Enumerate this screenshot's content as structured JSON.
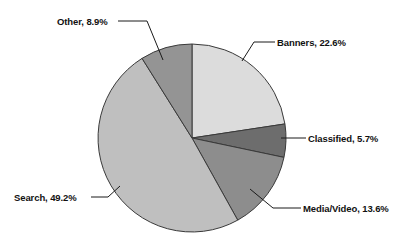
{
  "chart_data": {
    "type": "pie",
    "title": "",
    "subtitle": "",
    "xlabel": "",
    "ylabel": "",
    "legend_position": "none",
    "grid": false,
    "labels_format": "{name}, {value}%",
    "start_angle_deg": 0,
    "direction": "clockwise",
    "categories": [
      "Banners",
      "Classified",
      "Media/Video",
      "Search",
      "Other"
    ],
    "values": [
      22.6,
      5.7,
      13.6,
      49.2,
      8.9
    ],
    "units": "percent",
    "total": 100.0,
    "colors": [
      "#dcdcdc",
      "#6d6d6d",
      "#8d8d8d",
      "#bfbfbf",
      "#949494"
    ],
    "slices": [
      {
        "name": "Banners",
        "value": 22.6,
        "label": "Banners, 22.6%",
        "color": "#dcdcdc",
        "start_deg": 0.0,
        "end_deg": 81.4
      },
      {
        "name": "Classified",
        "value": 5.7,
        "label": "Classified, 5.7%",
        "color": "#6d6d6d",
        "start_deg": 81.4,
        "end_deg": 101.9
      },
      {
        "name": "Media/Video",
        "value": 13.6,
        "label": "Media/Video, 13.6%",
        "color": "#8d8d8d",
        "start_deg": 101.9,
        "end_deg": 150.9
      },
      {
        "name": "Search",
        "value": 49.2,
        "label": "Search, 49.2%",
        "color": "#bfbfbf",
        "start_deg": 150.9,
        "end_deg": 327.9
      },
      {
        "name": "Other",
        "value": 8.9,
        "label": "Other, 8.9%",
        "color": "#949494",
        "start_deg": 327.9,
        "end_deg": 360.0
      }
    ]
  },
  "labels": {
    "other": "Other, 8.9%",
    "banners": "Banners, 22.6%",
    "classified": "Classified, 5.7%",
    "media_video": "Media/Video, 13.6%",
    "search": "Search, 49.2%"
  },
  "colors": {
    "background": "#ffffff",
    "text": "#111111",
    "slice_outline": "#3a3a3a",
    "leader_line": "#1a1a1a",
    "banners": "#dcdcdc",
    "classified": "#6d6d6d",
    "media_video": "#8d8d8d",
    "search": "#bfbfbf",
    "other": "#949494"
  }
}
